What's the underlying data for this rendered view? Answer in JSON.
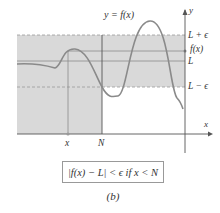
{
  "diagram": {
    "curve_label": "y = f(x)",
    "y_axis_label": "y",
    "x_axis_label": "x",
    "right_labels": {
      "upper": "L + ϵ",
      "fx": "f(x)",
      "limit": "L",
      "lower": "L − ϵ"
    },
    "x_axis_ticks": {
      "x_point": "x",
      "n_point": "N"
    },
    "caption": "|f(x) − L| < ϵ if x < N",
    "panel_label": "(b)",
    "colors": {
      "band": "#d9d9d9",
      "curve": "#8a8a8a",
      "axis": "#555555",
      "dashed": "#9a9a9a"
    }
  }
}
